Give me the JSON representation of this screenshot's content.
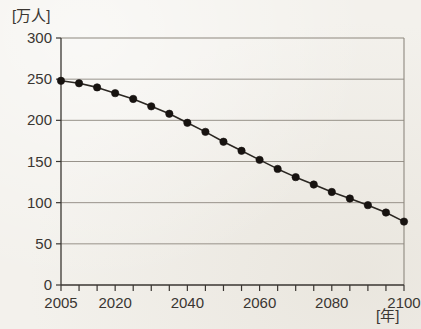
{
  "chart_data": {
    "type": "line",
    "title": "",
    "xlabel": "[年]",
    "ylabel": "[万人]",
    "ylim": [
      0,
      300
    ],
    "xlim": [
      2005,
      2100
    ],
    "grid": true,
    "legend": false,
    "y_ticks": [
      0,
      50,
      100,
      150,
      200,
      250,
      300
    ],
    "x_ticks": [
      2005,
      2010,
      2015,
      2020,
      2025,
      2030,
      2035,
      2040,
      2045,
      2050,
      2055,
      2060,
      2065,
      2070,
      2075,
      2080,
      2085,
      2090,
      2095,
      2100
    ],
    "x_tick_labels_shown": [
      "2005",
      "2020",
      "2040",
      "2060",
      "2080",
      "2100"
    ],
    "x": [
      2005,
      2010,
      2015,
      2020,
      2025,
      2030,
      2035,
      2040,
      2045,
      2050,
      2055,
      2060,
      2065,
      2070,
      2075,
      2080,
      2085,
      2090,
      2095,
      2100
    ],
    "values": [
      248,
      245,
      240,
      233,
      226,
      217,
      208,
      197,
      186,
      174,
      163,
      152,
      141,
      131,
      122,
      113,
      105,
      97,
      88,
      77
    ],
    "marker": "filled-circle",
    "line_color": "#2b2722",
    "marker_color": "#171310",
    "grid_color": "#8d887f",
    "axis_color": "#3a3632"
  },
  "axis": {
    "y_unit_label": "[万人]",
    "x_unit_label": "[年]"
  }
}
